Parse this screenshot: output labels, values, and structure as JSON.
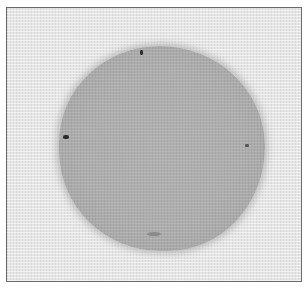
{
  "image": {
    "description": "Grayscale photograph of a roughly circular grey stain on woven fabric, framed with a thin dark border",
    "colors": {
      "fabric": "#e6e6e6",
      "stain": "#adadad",
      "border": "#6a6a6a",
      "marks": "#2b2b2b"
    },
    "marks": [
      "top",
      "left",
      "right",
      "bottom"
    ]
  }
}
